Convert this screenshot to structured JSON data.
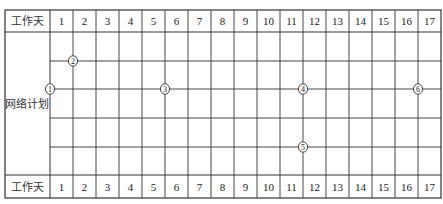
{
  "table": {
    "header_label": "工作天",
    "footer_label": "工作天",
    "row_label": "网络计划",
    "days": [
      "1",
      "2",
      "3",
      "4",
      "5",
      "6",
      "7",
      "8",
      "9",
      "10",
      "11",
      "12",
      "13",
      "14",
      "15",
      "16",
      "17"
    ]
  },
  "nodes": [
    {
      "id": "1",
      "glyph": "1",
      "day_boundary": 0,
      "row_line": 2
    },
    {
      "id": "2",
      "glyph": "2",
      "day_boundary": 1,
      "row_line": 1
    },
    {
      "id": "3",
      "glyph": "3",
      "day_boundary": 5,
      "row_line": 2
    },
    {
      "id": "4",
      "glyph": "4",
      "day_boundary": 11,
      "row_line": 2
    },
    {
      "id": "5",
      "glyph": "5",
      "day_boundary": 11,
      "row_line": 4
    },
    {
      "id": "6",
      "glyph": "6",
      "day_boundary": 16,
      "row_line": 2
    }
  ],
  "colors": {
    "line": "#333333",
    "background": "#ffffff",
    "text": "#222222"
  }
}
